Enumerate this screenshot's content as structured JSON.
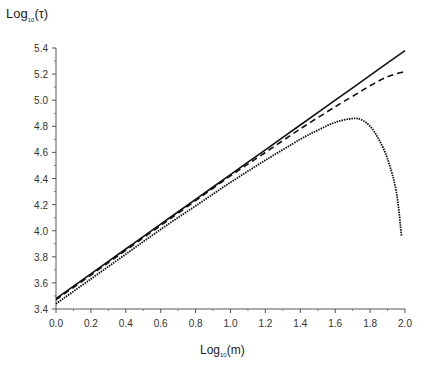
{
  "chart_data": {
    "type": "line",
    "title": "",
    "xlabel": "Log10(m)",
    "ylabel": "Log10(τ)",
    "xlabel_parts": {
      "prefix": "Log",
      "sub": "10",
      "suffix": "(m)"
    },
    "ylabel_parts": {
      "prefix": "Log",
      "sub": "10",
      "suffix": "(τ)"
    },
    "xlim": [
      0.0,
      2.0
    ],
    "ylim": [
      3.4,
      5.4
    ],
    "xticks": [
      "0.0",
      "0.2",
      "0.4",
      "0.6",
      "0.8",
      "1.0",
      "1.2",
      "1.4",
      "1.6",
      "1.8",
      "2.0"
    ],
    "yticks": [
      "3.4",
      "3.6",
      "3.8",
      "4.0",
      "4.2",
      "4.4",
      "4.6",
      "4.8",
      "5.0",
      "5.2",
      "5.4"
    ],
    "grid": false,
    "legend": null,
    "series": [
      {
        "name": "solid",
        "style": "solid",
        "color": "#111111",
        "x": [
          0.0,
          0.2,
          0.4,
          0.6,
          0.8,
          1.0,
          1.2,
          1.4,
          1.6,
          1.8,
          2.0
        ],
        "y": [
          3.48,
          3.67,
          3.86,
          4.05,
          4.24,
          4.43,
          4.62,
          4.81,
          5.0,
          5.19,
          5.38
        ]
      },
      {
        "name": "dashed",
        "style": "dashed",
        "color": "#111111",
        "x": [
          0.0,
          0.2,
          0.4,
          0.6,
          0.8,
          1.0,
          1.2,
          1.4,
          1.6,
          1.7,
          1.8,
          1.9,
          2.0
        ],
        "y": [
          3.47,
          3.66,
          3.85,
          4.04,
          4.23,
          4.42,
          4.6,
          4.78,
          4.95,
          5.03,
          5.11,
          5.18,
          5.22
        ]
      },
      {
        "name": "dotted",
        "style": "dotted",
        "color": "#111111",
        "x": [
          0.0,
          0.2,
          0.4,
          0.6,
          0.8,
          1.0,
          1.2,
          1.4,
          1.5,
          1.6,
          1.7,
          1.75,
          1.8,
          1.85,
          1.9,
          1.95,
          1.98
        ],
        "y": [
          3.44,
          3.63,
          3.82,
          4.01,
          4.19,
          4.37,
          4.54,
          4.7,
          4.77,
          4.83,
          4.86,
          4.85,
          4.8,
          4.7,
          4.55,
          4.3,
          3.96
        ]
      }
    ]
  }
}
